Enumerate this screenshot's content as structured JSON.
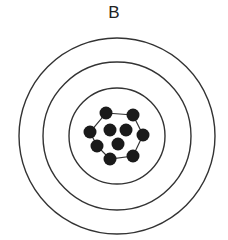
{
  "diagram": {
    "label": "B",
    "target": {
      "center": [
        117,
        136
      ],
      "rings": [
        98,
        74,
        48
      ],
      "ring_color": "#333333"
    },
    "shots": {
      "count": 10,
      "color": "#1a1a1a",
      "radius": 6.5,
      "points": [
        [
          106,
          113
        ],
        [
          133,
          115
        ],
        [
          90,
          132
        ],
        [
          110,
          130
        ],
        [
          126,
          130
        ],
        [
          143,
          135
        ],
        [
          97,
          146
        ],
        [
          118,
          144
        ],
        [
          110,
          159
        ],
        [
          133,
          156
        ]
      ],
      "hull": [
        [
          106,
          113
        ],
        [
          133,
          115
        ],
        [
          143,
          135
        ],
        [
          133,
          156
        ],
        [
          110,
          159
        ],
        [
          97,
          146
        ],
        [
          90,
          132
        ]
      ]
    }
  }
}
